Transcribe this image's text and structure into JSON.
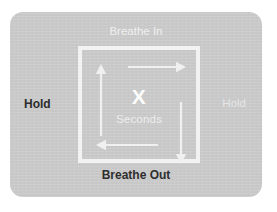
{
  "canvas": {
    "width": 277,
    "height": 212,
    "background_color": "#ffffff"
  },
  "card": {
    "background_color": "#c7c7c7",
    "corner_radius": 13
  },
  "diagram": {
    "title_implied": "Box Breathing",
    "square": {
      "border_color": "#f2f2f2",
      "border_width": 4
    },
    "center": {
      "duration_value": "X",
      "duration_unit": "Seconds",
      "value_color": "#fdfdfd",
      "unit_color": "#ededed"
    },
    "arrows": [
      {
        "name": "arrow-up-icon",
        "direction": "up",
        "side": "left",
        "color": "#f0f0f0"
      },
      {
        "name": "arrow-right-icon",
        "direction": "right",
        "side": "top",
        "color": "#f0f0f0"
      },
      {
        "name": "arrow-down-icon",
        "direction": "down",
        "side": "right",
        "color": "#f0f0f0"
      },
      {
        "name": "arrow-left-icon",
        "direction": "left",
        "side": "bottom",
        "color": "#f0f0f0"
      }
    ],
    "labels": {
      "top": {
        "text": "Breathe In",
        "color": "#f0f0f0",
        "weight": "regular"
      },
      "right": {
        "text": "Hold",
        "color": "#e6e6e6",
        "weight": "regular"
      },
      "bottom": {
        "text": "Breathe Out",
        "color": "#2e2e2e",
        "weight": "bold"
      },
      "left": {
        "text": "Hold",
        "color": "#2e2e2e",
        "weight": "bold"
      }
    }
  }
}
